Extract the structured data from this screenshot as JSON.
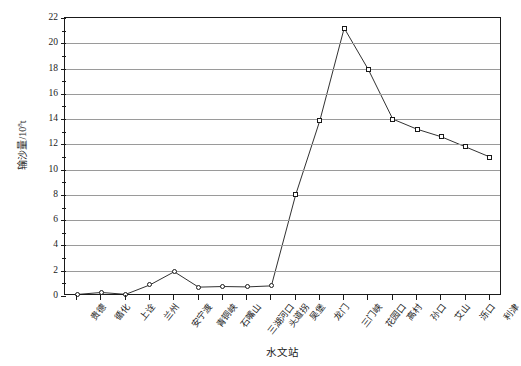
{
  "chart_data": {
    "type": "line",
    "title": "",
    "xlabel": "水文站",
    "ylabel": "输沙量/10",
    "ylabel_sup": "8",
    "ylabel_unit": "t",
    "ylim": [
      0,
      22
    ],
    "ytick_step": 2,
    "yminor_step": 1,
    "grid": true,
    "legend": "none",
    "categories": [
      "贵德",
      "循化",
      "上诠",
      "兰州",
      "安宁渡",
      "青铜峡",
      "石嘴山",
      "三湖河口",
      "头道拐",
      "吴堡",
      "龙门",
      "三门峡",
      "花园口",
      "高村",
      "孙口",
      "艾山",
      "泺口",
      "利津"
    ],
    "values": [
      0.12,
      0.28,
      0.13,
      0.88,
      1.92,
      0.7,
      0.75,
      0.72,
      0.8,
      8.0,
      13.9,
      21.2,
      17.9,
      14.0,
      13.2,
      12.6,
      11.8,
      11.0
    ],
    "ytick_labels": [
      "0",
      "2",
      "4",
      "6",
      "8",
      "10",
      "12",
      "14",
      "16",
      "18",
      "20",
      "22"
    ]
  }
}
